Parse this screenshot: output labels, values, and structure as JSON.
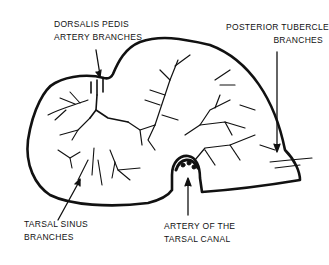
{
  "diagram": {
    "labels": {
      "dorsalis_pedis": {
        "line1": "DORSALIS PEDIS",
        "line2": "ARTERY BRANCHES"
      },
      "posterior_tubercle": {
        "line1": "POSTERIOR TUBERCLE",
        "line2": "BRANCHES"
      },
      "tarsal_sinus": {
        "line1": "TARSAL SINUS",
        "line2": "BRANCHES"
      },
      "tarsal_canal": {
        "line1": "ARTERY OF THE",
        "line2": "TARSAL CANAL"
      }
    },
    "colors": {
      "line": "#111111",
      "background": "#ffffff"
    }
  }
}
